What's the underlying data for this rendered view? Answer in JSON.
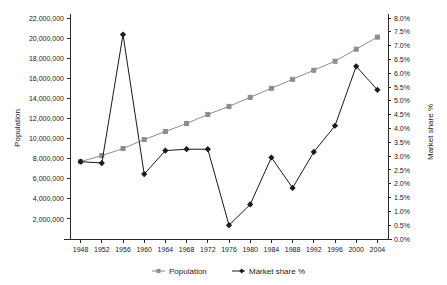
{
  "chart_data": {
    "type": "line",
    "title": "",
    "xlabel": "",
    "ylabel": "Population",
    "y2label": "Market share %",
    "grid": false,
    "legend_position": "bottom",
    "x": [
      1948,
      1952,
      1956,
      1960,
      1964,
      1968,
      1972,
      1976,
      1980,
      1984,
      1988,
      1992,
      1996,
      2000,
      2004
    ],
    "xtick_labels": [
      "1948",
      "1952",
      "1956",
      "1960",
      "1964",
      "1968",
      "1972",
      "1976",
      "1980",
      "1984",
      "1988",
      "1992",
      "1996",
      "2000",
      "2004"
    ],
    "xlim": [
      1946,
      2006
    ],
    "ylim": [
      0,
      22000000
    ],
    "ytick_labels": [
      "2,000,000",
      "4,000,000",
      "6,000,000",
      "8,000,000",
      "10,000,000",
      "12,000,000",
      "14,000,000",
      "16,000,000",
      "18,000,000",
      "20,000,000",
      "22,000,000"
    ],
    "ytick_values": [
      2000000,
      4000000,
      6000000,
      8000000,
      10000000,
      12000000,
      14000000,
      16000000,
      18000000,
      20000000,
      22000000
    ],
    "y2lim": [
      0,
      8
    ],
    "y2tick_labels": [
      "0.0%",
      "0.5%",
      "1.0%",
      "1.5%",
      "2.0%",
      "2.5%",
      "3.0%",
      "3.5%",
      "4.0%",
      "4.5%",
      "5.0%",
      "5.5%",
      "6.0%",
      "6.5%",
      "7.0%",
      "7.5%",
      "8.0%"
    ],
    "y2tick_values": [
      0,
      0.5,
      1.0,
      1.5,
      2.0,
      2.5,
      3.0,
      3.5,
      4.0,
      4.5,
      5.0,
      5.5,
      6.0,
      6.5,
      7.0,
      7.5,
      8.0
    ],
    "series": [
      {
        "name": "Population",
        "axis": "left",
        "color": "#8c8c8c",
        "marker": "square",
        "values": [
          7700000,
          8300000,
          9000000,
          9900000,
          10700000,
          11500000,
          12400000,
          13200000,
          14100000,
          15000000,
          15900000,
          16800000,
          17700000,
          18900000,
          20100000
        ]
      },
      {
        "name": "Market share %",
        "axis": "right",
        "color": "#1a1a1a",
        "marker": "diamond",
        "values": [
          2.8,
          2.75,
          7.4,
          2.35,
          3.2,
          3.25,
          3.25,
          0.5,
          1.25,
          2.95,
          1.85,
          3.15,
          4.1,
          6.25,
          5.4
        ]
      }
    ]
  },
  "legend": {
    "items": [
      {
        "label": "Population",
        "color": "#8c8c8c"
      },
      {
        "label": "Market share %",
        "color": "#1a1a1a"
      }
    ]
  },
  "axes": {
    "left_title": "Population",
    "right_title": "Market share %"
  }
}
